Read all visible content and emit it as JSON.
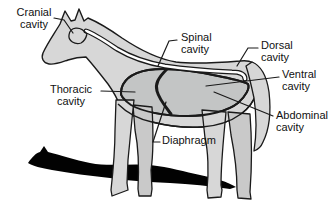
{
  "figure": {
    "labels": {
      "cranial": {
        "line1": "Cranial",
        "line2": "cavity"
      },
      "spinal": {
        "line1": "Spinal",
        "line2": "cavity"
      },
      "dorsal": {
        "line1": "Dorsal",
        "line2": "cavity"
      },
      "ventral": {
        "line1": "Ventral",
        "line2": "cavity"
      },
      "thoracic": {
        "line1": "Thoracic",
        "line2": "cavity"
      },
      "abdominal": {
        "line1": "Abdominal",
        "line2": "cavity"
      },
      "diaphragm": {
        "line1": "Diaphragm"
      }
    }
  },
  "colors": {
    "background": "#ffffff",
    "body": "#d7d7d7",
    "farLeg": "#c9c9c9",
    "cavity": "#c3c5c5",
    "tube": "#ffffff",
    "outline": "#1a1a1a",
    "shadow": "#020202"
  }
}
